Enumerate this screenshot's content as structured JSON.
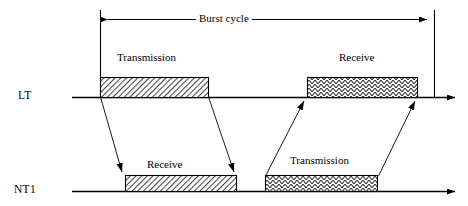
{
  "diagram": {
    "title_annotation": "Burst cycle",
    "rows": [
      {
        "id": "lt",
        "label": "LT"
      },
      {
        "id": "nt1",
        "label": "NT1"
      }
    ],
    "blocks": [
      {
        "id": "lt-transmission",
        "row": "LT",
        "label": "Transmission",
        "hatch": "diagonal-dense"
      },
      {
        "id": "lt-receive",
        "row": "LT",
        "label": "Receive",
        "hatch": "zigzag"
      },
      {
        "id": "nt1-receive",
        "row": "NT1",
        "label": "Receive",
        "hatch": "diagonal-dense"
      },
      {
        "id": "nt1-transmission",
        "row": "NT1",
        "label": "Transmission",
        "hatch": "zigzag"
      }
    ],
    "colors": {
      "line": "#000000",
      "background": "#ffffff",
      "hatch": "#3a3a3a"
    }
  }
}
